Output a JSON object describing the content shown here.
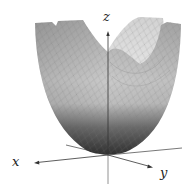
{
  "figure": {
    "type": "3d-surface-plot",
    "surface": "paraboloid",
    "axes": {
      "x_label": "x",
      "y_label": "y",
      "z_label": "z"
    },
    "colors": {
      "surface_light": "#d8d8d8",
      "surface_mid": "#a8a8a8",
      "surface_dark": "#3c3c3c",
      "axis": "#333333",
      "mesh": "#8a8a8a"
    }
  }
}
